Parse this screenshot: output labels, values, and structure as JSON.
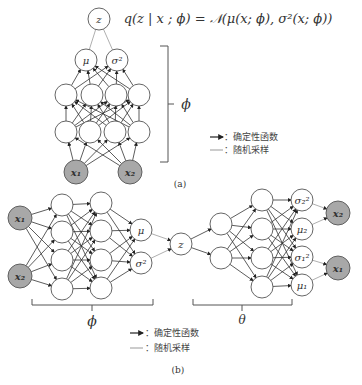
{
  "formula": "q(z | x ; ϕ) = 𝒩(μ(x; ϕ), σ²(x; ϕ))",
  "colors": {
    "stroke": "#555555",
    "light_stroke": "#9a9a9a",
    "observed_fill": "#a8a8a8",
    "node_fill": "#ffffff"
  },
  "panel_a": {
    "caption": "(a)",
    "bracket_label": "ϕ",
    "nodes": {
      "z": {
        "label": "z"
      },
      "mu": {
        "label": "μ"
      },
      "sigma2": {
        "label": "σ²"
      },
      "x1": {
        "label": "x₁"
      },
      "x2": {
        "label": "x₂"
      }
    },
    "legend": {
      "deterministic": "：确定性函数",
      "stochastic": "：随机采样"
    }
  },
  "panel_b": {
    "caption": "(b)",
    "encoder_label": "ϕ",
    "decoder_label": "θ",
    "nodes": {
      "x1_in": "x₁",
      "x2_in": "x₂",
      "mu": "μ",
      "sigma2": "σ²",
      "z": "z",
      "sigma2_2": "σ₂²",
      "mu_2": "μ₂",
      "sigma1_2": "σ₁²",
      "mu_1": "μ₁",
      "x2_out": "x₂",
      "x1_out": "x₁"
    },
    "legend": {
      "deterministic": "：确定性函数",
      "stochastic": "：随机采样"
    }
  }
}
